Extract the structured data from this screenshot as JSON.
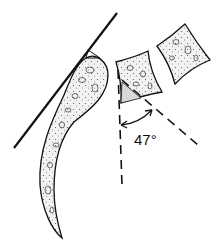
{
  "diagram": {
    "angle_label": "47°",
    "colors": {
      "stroke": "#111111",
      "fill": "#ececec",
      "background": "#ffffff"
    }
  }
}
